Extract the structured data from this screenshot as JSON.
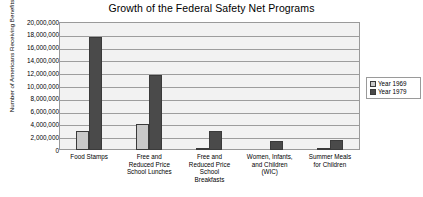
{
  "chart_data": {
    "type": "bar",
    "title": "Growth of the Federal Safety Net Programs",
    "xlabel": "",
    "ylabel": "Number of Americans Receiving Benefits",
    "ylim": [
      0,
      20000000
    ],
    "ytick_step": 2000000,
    "grid": true,
    "legend_position": "right",
    "categories": [
      "Food Stamps",
      "Free and Reduced Price School Lunches",
      "Free and Reduced Price School Breakfasts",
      "Women, Infants, and Children (WIC)",
      "Summer Meals for Children"
    ],
    "category_lines": [
      [
        "Food Stamps"
      ],
      [
        "Free and",
        "Reduced Price",
        "School Lunches"
      ],
      [
        "Free and",
        "Reduced Price",
        "School",
        "Breakfasts"
      ],
      [
        "Women, Infants,",
        "and Children",
        "(WIC)"
      ],
      [
        "Summer Meals",
        "for Children"
      ]
    ],
    "ytick_labels": [
      "20,000,000",
      "18,000,000",
      "16,000,000",
      "14,000,000",
      "12,000,000",
      "10,000,000",
      "8,000,000",
      "6,000,000",
      "4,000,000",
      "2,000,000",
      "0"
    ],
    "series": [
      {
        "name": "Year 1969",
        "color": "#c9c9c9",
        "values": [
          3000000,
          4000000,
          100000,
          0,
          100000
        ]
      },
      {
        "name": "Year 1979",
        "color": "#4a4a4a",
        "values": [
          17600000,
          11700000,
          3000000,
          1400000,
          1500000
        ]
      }
    ]
  },
  "legend": {
    "items": [
      {
        "label": "Year 1969"
      },
      {
        "label": "Year 1979"
      }
    ]
  }
}
